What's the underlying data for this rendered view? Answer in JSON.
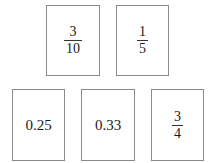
{
  "cards": [
    {
      "type": "fraction",
      "numerator": "3",
      "denominator": "10"
    },
    {
      "type": "fraction",
      "numerator": "1",
      "denominator": "5"
    },
    {
      "type": "decimal",
      "value": "0.25"
    },
    {
      "type": "decimal",
      "value": "0.33"
    },
    {
      "type": "fraction",
      "numerator": "3",
      "denominator": "4"
    }
  ]
}
